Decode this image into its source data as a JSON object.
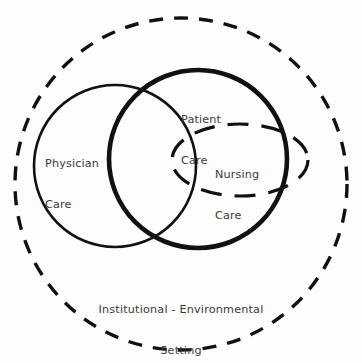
{
  "figure": {
    "type": "venn-diagram",
    "title_text_present": false,
    "background_color": "#fdfdfd",
    "stroke_color": "#111111"
  },
  "labels": {
    "physician_care": {
      "line1": "Physician",
      "line2": "Care"
    },
    "patient_care": {
      "line1": "Patient",
      "line2": "Care"
    },
    "nursing_care": {
      "line1": "Nursing",
      "line2": "Care"
    },
    "institutional_setting": {
      "line1": "Institutional - Environmental",
      "line2": "Setting"
    }
  },
  "shapes": {
    "outer_boundary": {
      "name": "Institutional - Environmental Setting",
      "shape": "circle",
      "style": "dashed",
      "cx": 181,
      "cy": 184,
      "r": 166,
      "stroke_width": 3.4,
      "dash": "14 11",
      "color": "#111111"
    },
    "physician_circle": {
      "name": "Physician Care",
      "shape": "circle",
      "style": "solid",
      "cx": 115,
      "cy": 166,
      "r": 81,
      "stroke_width": 2.6,
      "color": "#111111"
    },
    "patient_circle": {
      "name": "Patient Care",
      "shape": "circle",
      "style": "solid-bold",
      "cx": 198,
      "cy": 159,
      "r": 89,
      "stroke_width": 4.6,
      "color": "#111111"
    },
    "nursing_ellipse": {
      "name": "Nursing Care",
      "shape": "ellipse",
      "style": "dashed",
      "cx": 240,
      "cy": 160,
      "rx": 68,
      "ry": 36,
      "stroke_width": 3.2,
      "dash": "21 13",
      "color": "#111111"
    }
  }
}
